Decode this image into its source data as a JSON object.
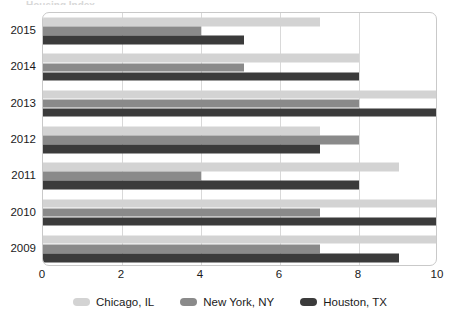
{
  "title_remnant": "Housing Index",
  "chart_data": {
    "type": "bar",
    "orientation": "horizontal",
    "title": "",
    "xlabel": "",
    "ylabel": "",
    "categories": [
      "2015",
      "2014",
      "2013",
      "2012",
      "2011",
      "2010",
      "2009"
    ],
    "series": [
      {
        "name": "Chicago, IL",
        "color": "#d3d3d3",
        "values": [
          7,
          8,
          10,
          7,
          9,
          10,
          10
        ]
      },
      {
        "name": "New York, NY",
        "color": "#8a8a8a",
        "values": [
          4,
          5.1,
          8,
          8,
          4,
          7,
          7
        ]
      },
      {
        "name": "Houston, TX",
        "color": "#3b3b3b",
        "values": [
          5.1,
          8,
          10,
          7,
          8,
          10,
          9
        ]
      }
    ],
    "xlim": [
      0,
      10
    ],
    "xticks": [
      0,
      2,
      4,
      6,
      8,
      10
    ],
    "xtick_labels": [
      "0",
      "2",
      "4",
      "6",
      "8",
      "10"
    ],
    "grid": "vertical",
    "legend_position": "bottom"
  },
  "legend": {
    "items": [
      {
        "label": "Chicago, IL",
        "color": "#d3d3d3"
      },
      {
        "label": "New York, NY",
        "color": "#8a8a8a"
      },
      {
        "label": "Houston, TX",
        "color": "#3b3b3b"
      }
    ]
  },
  "colors": {
    "plot_border": "#c9c9c9",
    "gridline": "#d9d9d9",
    "background": "#ffffff",
    "text": "#1a1a1a"
  }
}
